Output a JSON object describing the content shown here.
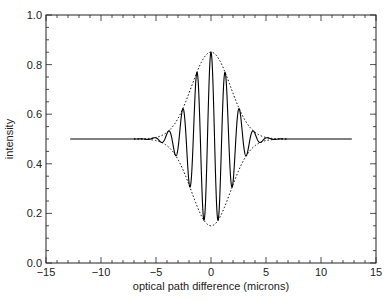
{
  "chart_data": {
    "type": "line",
    "title": "",
    "xlabel": "optical path difference (microns)",
    "ylabel": "intensity",
    "xlim": [
      -15,
      15
    ],
    "ylim": [
      0.0,
      1.0
    ],
    "x_ticks": [
      -15,
      -10,
      -5,
      0,
      5,
      10,
      15
    ],
    "x_tick_labels": [
      "−15",
      "−10",
      "−5",
      "0",
      "5",
      "10",
      "15"
    ],
    "y_ticks": [
      0.0,
      0.2,
      0.4,
      0.6,
      0.8,
      1.0
    ],
    "y_tick_labels": [
      "0.0",
      "0.2",
      "0.4",
      "0.6",
      "0.8",
      "1.0"
    ],
    "x_minor_step": 1,
    "y_minor_step": 0.05,
    "grid": false,
    "legend": null,
    "series": [
      {
        "name": "interferogram",
        "style": "solid",
        "color": "#000000",
        "model": "0.5 + 0.35*exp(-(x/2.5)^2)*cos(2*pi*x/1.29)",
        "x_range": [
          -12.8,
          12.8
        ],
        "baseline": 0.5,
        "amplitude": 0.35,
        "envelope_sigma": 2.5,
        "fringe_period": 1.29,
        "sample_points": [
          {
            "x": -3.87,
            "y": 0.53
          },
          {
            "x": -2.58,
            "y": 0.62
          },
          {
            "x": -1.94,
            "y": 0.3
          },
          {
            "x": -1.29,
            "y": 0.77
          },
          {
            "x": -0.645,
            "y": 0.17
          },
          {
            "x": 0.0,
            "y": 0.85
          },
          {
            "x": 0.645,
            "y": 0.17
          },
          {
            "x": 1.29,
            "y": 0.77
          },
          {
            "x": 1.94,
            "y": 0.3
          },
          {
            "x": 2.58,
            "y": 0.62
          },
          {
            "x": 3.87,
            "y": 0.53
          }
        ]
      },
      {
        "name": "upper envelope",
        "style": "dotted",
        "color": "#000000",
        "model": "0.5 + 0.35*exp(-(x/2.5)^2)",
        "x_range": [
          -7,
          7
        ],
        "peak": 0.85
      },
      {
        "name": "lower envelope",
        "style": "dotted",
        "color": "#000000",
        "model": "0.5 - 0.35*exp(-(x/2.5)^2)",
        "x_range": [
          -7,
          7
        ],
        "trough": 0.15
      }
    ]
  },
  "layout": {
    "plot_left": 46,
    "plot_right": 376,
    "plot_top": 15,
    "plot_bottom": 263
  }
}
